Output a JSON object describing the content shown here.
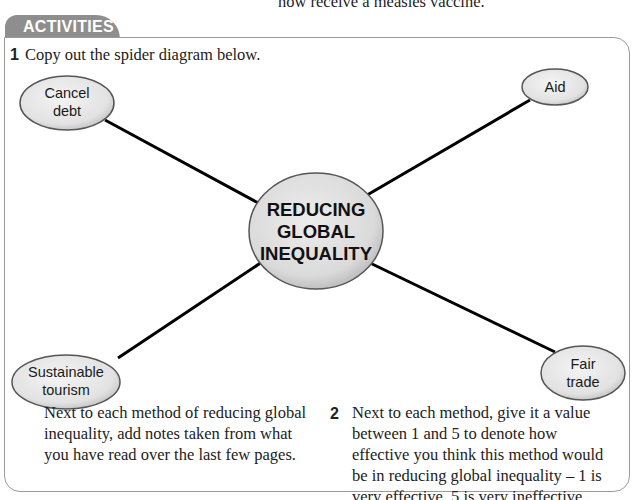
{
  "page": {
    "top_fragment": "now receive a measles vaccine."
  },
  "activities": {
    "tab_label": "ACTIVITIES",
    "question1": {
      "number": "1",
      "text": "Copy out the spider diagram below."
    },
    "spider_diagram": {
      "center": {
        "line1": "REDUCING",
        "line2": "GLOBAL",
        "line3": "INEQUALITY"
      },
      "nodes": [
        {
          "id": "cancel-debt",
          "line1": "Cancel",
          "line2": "debt"
        },
        {
          "id": "aid",
          "line1": "Aid",
          "line2": ""
        },
        {
          "id": "sustainable-tourism",
          "line1": "Sustainable",
          "line2": "tourism"
        },
        {
          "id": "fair-trade",
          "line1": "Fair",
          "line2": "trade"
        }
      ],
      "colors": {
        "node_fill": "#e8e8e8",
        "node_stroke": "#555555",
        "connector": "#000000"
      }
    },
    "note_text": "Next to each method of reducing global inequality, add notes taken from what you have read over the last few pages.",
    "question2": {
      "number": "2",
      "text": "Next to each method, give it a value between 1 and 5 to denote how effective you think this method would be in reducing global inequality – 1 is very effective, 5 is very ineffective."
    },
    "colors": {
      "tab_background": "#8e8e8e",
      "tab_text": "#ffffff",
      "box_border": "#9a9a9a"
    }
  }
}
